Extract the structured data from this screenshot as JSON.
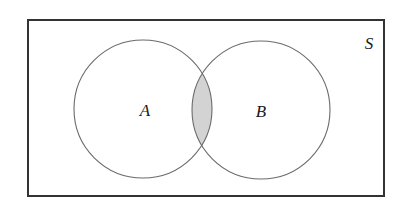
{
  "diagram": {
    "type": "venn",
    "universe": {
      "label": "S",
      "rect": {
        "x": 28,
        "y": 20,
        "width": 356,
        "height": 176
      },
      "label_pos": {
        "x": 369,
        "y": 49
      }
    },
    "sets": [
      {
        "id": "A",
        "label": "A",
        "cx": 143,
        "cy": 109,
        "r": 69,
        "label_pos": {
          "x": 145,
          "y": 116
        }
      },
      {
        "id": "B",
        "label": "B",
        "cx": 261,
        "cy": 110,
        "r": 69,
        "label_pos": {
          "x": 261,
          "y": 117
        }
      }
    ],
    "shaded_region": "A ∩ B",
    "colors": {
      "border": "#333333",
      "circle_stroke": "#6b6b6b",
      "shade_fill": "#d3d3d3",
      "background": "#ffffff",
      "text": "#1a1a1a"
    }
  }
}
